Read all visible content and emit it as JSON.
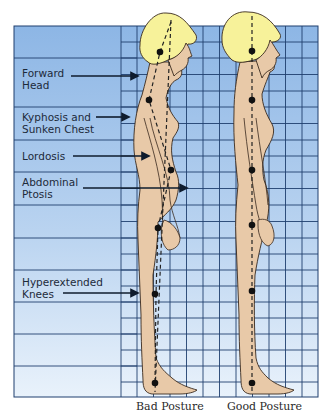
{
  "diagram": {
    "labels": [
      {
        "id": "forward-head",
        "line1": "Forward",
        "line2": "Head"
      },
      {
        "id": "kyphosis",
        "line1": "Kyphosis and",
        "line2": "Sunken Chest"
      },
      {
        "id": "lordosis",
        "line1": "Lordosis",
        "line2": ""
      },
      {
        "id": "abdominal-ptosis",
        "line1": "Abdominal",
        "line2": "Ptosis"
      },
      {
        "id": "hyperextended-knees",
        "line1": "Hyperextended",
        "line2": "Knees"
      }
    ],
    "captions": {
      "bad": "Bad Posture",
      "good": "Good Posture"
    },
    "colors": {
      "grid_bg_top": "#8fb8e6",
      "grid_bg_bottom": "#e6f0fb",
      "grid_line": "#1f3f6e",
      "skin": "#e8c9a8",
      "hair": "#f7f29a",
      "outline": "#3a2a1e",
      "dot": "#111111"
    }
  }
}
